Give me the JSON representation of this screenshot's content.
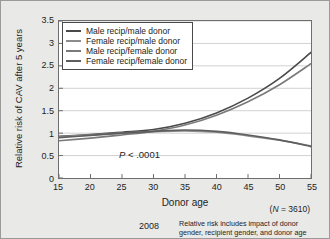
{
  "figure": {
    "year": "2008",
    "caption_line1": "Relative risk includes impact of donor",
    "caption_line2": "gender, recipient gender, and donor age",
    "n_label_prefix": "(",
    "n_label_italic": "N",
    "n_label_suffix": " = 3610)",
    "pvalue_italic": "P",
    "pvalue_rest": " < .0001",
    "background_color": "#e9e9e7",
    "plot_background_color": "#ffffff",
    "frame_color": "#6e6e6e",
    "gridline_color": "#d2d2d2"
  },
  "chart_data": {
    "type": "line",
    "title": "",
    "xlabel": "Donor age",
    "ylabel": "Relative risk of CAV after 5 years",
    "xlim": [
      15,
      55
    ],
    "ylim": [
      0,
      3.5
    ],
    "xticks": [
      15,
      20,
      25,
      30,
      35,
      40,
      45,
      50,
      55
    ],
    "xticklabels": [
      "15",
      "20",
      "25",
      "30",
      "35",
      "40",
      "45",
      "50",
      "55"
    ],
    "yticks": [
      0,
      0.5,
      1,
      1.5,
      2,
      2.5,
      3,
      3.5
    ],
    "yticklabels": [
      "0",
      "0.5",
      "1",
      "1.5",
      "2",
      "2.5",
      "3",
      "3.5"
    ],
    "grid": "horizontal",
    "legend_position": "top-left",
    "annotations": [
      {
        "text": "P < .0001",
        "x": 30,
        "y": 0.35
      },
      {
        "text": "(N = 3610)",
        "x": 55,
        "y": -0.55
      }
    ],
    "x": [
      15,
      20,
      25,
      30,
      35,
      40,
      45,
      50,
      55
    ],
    "series": [
      {
        "name": "Male recip/male donor",
        "color": "#4a4a4a",
        "values": [
          0.93,
          0.97,
          1.02,
          1.08,
          1.22,
          1.45,
          1.78,
          2.22,
          2.8
        ]
      },
      {
        "name": "Female recip/male donor",
        "color": "#8c8c8c",
        "values": [
          0.92,
          0.96,
          1.0,
          1.03,
          1.05,
          1.02,
          0.94,
          0.84,
          0.72
        ]
      },
      {
        "name": "Male recip/female donor",
        "color": "#7a7a7a",
        "values": [
          0.83,
          0.89,
          0.96,
          1.04,
          1.18,
          1.4,
          1.7,
          2.08,
          2.55
        ]
      },
      {
        "name": "Female recip/female donor",
        "color": "#5e5e5e",
        "values": [
          0.9,
          0.95,
          1.0,
          1.04,
          1.07,
          1.04,
          0.96,
          0.85,
          0.7
        ]
      }
    ]
  },
  "legend": {
    "items": [
      {
        "label": "Male recip/male donor",
        "color": "#4a4a4a"
      },
      {
        "label": "Female recip/male donor",
        "color": "#8c8c8c"
      },
      {
        "label": "Male recip/female donor",
        "color": "#7a7a7a"
      },
      {
        "label": "Female recip/female donor",
        "color": "#5e5e5e"
      }
    ]
  }
}
